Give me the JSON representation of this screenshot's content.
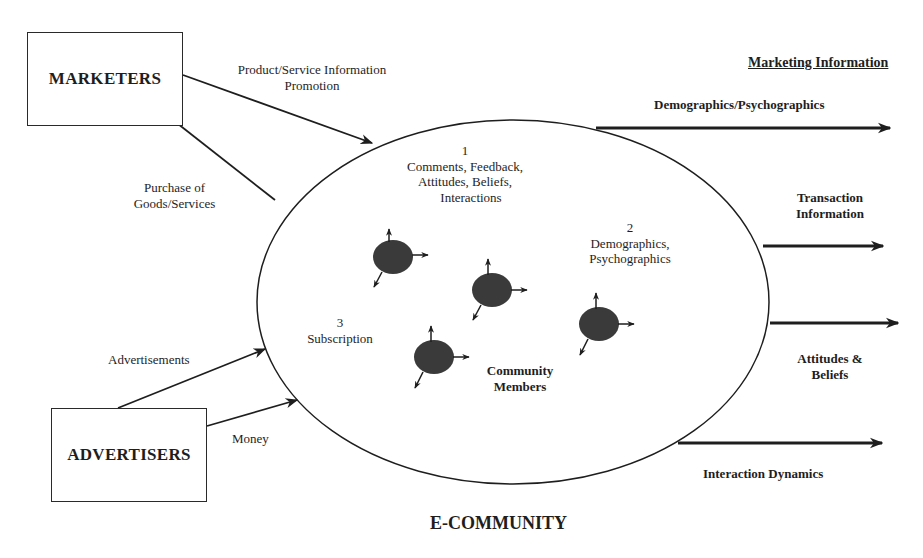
{
  "diagram": {
    "title": "E-COMMUNITY",
    "entities": {
      "marketers": "MARKETERS",
      "advertisers": "ADVERTISERS"
    },
    "flows": {
      "marketers_to_community_line1": "Product/Service Information",
      "marketers_to_community_line2": "Promotion",
      "community_to_marketers_line1": "Purchase of",
      "community_to_marketers_line2": "Goods/Services",
      "advertisers_ads": "Advertisements",
      "advertisers_money": "Money"
    },
    "community": {
      "item1_number": "1",
      "item1_line1": "Comments, Feedback,",
      "item1_line2": "Attitudes, Beliefs,",
      "item1_line3": "Interactions",
      "item2_number": "2",
      "item2_line1": "Demographics,",
      "item2_line2": "Psychographics",
      "item3_number": "3",
      "item3_line1": "Subscription",
      "members_line1": "Community",
      "members_line2": "Members"
    },
    "outputs": {
      "header": "Marketing Information",
      "out1": "Demographics/Psychographics",
      "out2_line1": "Transaction",
      "out2_line2": "Information",
      "out3_line1": "Attitudes &",
      "out3_line2": "Beliefs",
      "out4": "Interaction Dynamics"
    },
    "colors": {
      "ink": "#1e1e1e",
      "member_fill": "#3a3a3a",
      "background": "#ffffff"
    }
  }
}
